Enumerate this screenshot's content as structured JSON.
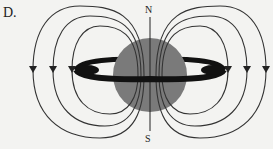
{
  "figure": {
    "option_label": "D.",
    "north_label": "N",
    "south_label": "S",
    "colors": {
      "background": "#f3f3f1",
      "planet": "#7a7a7a",
      "ring": "#111111",
      "field_lines": "#333333"
    }
  }
}
